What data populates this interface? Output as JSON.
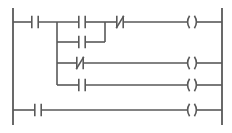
{
  "diagram": {
    "type": "ladder-logic",
    "colors": {
      "line": "#595959",
      "background": "#ffffff"
    },
    "geometry": {
      "width": 232,
      "height": 133,
      "left_rail_x": 13,
      "right_rail_x": 222,
      "rail_top_y": 8,
      "rail_bottom_y": 125,
      "branch_x": 57,
      "inner_join_x": 105,
      "coil_x": 192,
      "stroke_width": 1.6,
      "rail_stroke_width": 1.8
    },
    "rails": [
      {
        "name": "left-power-rail",
        "x": 13,
        "y1": 8,
        "y2": 125
      },
      {
        "name": "right-power-rail",
        "x": 222,
        "y1": 8,
        "y2": 125
      }
    ],
    "rungs": [
      {
        "id": "rung-1",
        "y": 22,
        "description": "Top rung: NO contact, then branch group, then NC contact to coil",
        "elements": [
          {
            "kind": "contact-no",
            "x": 35,
            "label": ""
          },
          {
            "kind": "contact-no",
            "x": 82,
            "label": ""
          },
          {
            "kind": "contact-nc",
            "x": 120,
            "label": ""
          }
        ],
        "coil": {
          "kind": "coil",
          "x": 192,
          "label": ""
        }
      },
      {
        "id": "rung-2",
        "y": 42,
        "description": "Parallel branch rejoining rung 1 at inner junction",
        "elements": [
          {
            "kind": "contact-no",
            "x": 82,
            "label": ""
          }
        ],
        "coil": null
      },
      {
        "id": "rung-3",
        "y": 63,
        "description": "Branch rung with NC contact driving its own coil",
        "elements": [
          {
            "kind": "contact-nc",
            "x": 80,
            "label": ""
          }
        ],
        "coil": {
          "kind": "coil",
          "x": 192,
          "label": ""
        }
      },
      {
        "id": "rung-4",
        "y": 85,
        "description": "Branch rung with NO contact driving its own coil",
        "elements": [
          {
            "kind": "contact-no",
            "x": 82,
            "label": ""
          }
        ],
        "coil": {
          "kind": "coil",
          "x": 192,
          "label": ""
        }
      },
      {
        "id": "rung-5",
        "y": 110,
        "description": "Bottom independent rung: NO contact driving coil",
        "elements": [
          {
            "kind": "contact-no",
            "x": 38,
            "label": ""
          }
        ],
        "coil": {
          "kind": "coil",
          "x": 192,
          "label": ""
        }
      }
    ],
    "branches": [
      {
        "name": "outer-branch-trunk",
        "x": 57,
        "y1": 22,
        "y2": 85
      },
      {
        "name": "inner-branch-join",
        "x": 105,
        "y1": 22,
        "y2": 42
      }
    ],
    "symbols": {
      "contact_no": "normally-open-contact",
      "contact_nc": "normally-closed-contact",
      "coil": "output-coil"
    }
  }
}
